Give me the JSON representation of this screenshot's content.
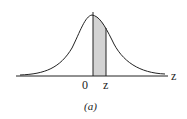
{
  "figure": {
    "caption": "(a)",
    "axis_label": "z",
    "tick_zero": "0",
    "tick_z": "z",
    "shade_color": "#d3d3d3",
    "line_color": "#222222"
  }
}
